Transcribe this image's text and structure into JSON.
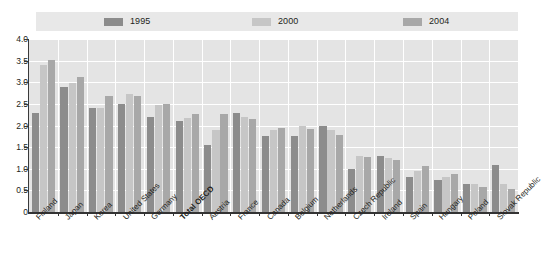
{
  "legend": {
    "items": [
      {
        "label": "1995",
        "color": "#8c8c8c"
      },
      {
        "label": "2000",
        "color": "#c6c6c6"
      },
      {
        "label": "2004",
        "color": "#a8a8a8"
      }
    ]
  },
  "axis": {
    "y_ticks": [
      "4.0",
      "3.5",
      "3.0",
      "2.5",
      "2.0",
      "1.5",
      "1.0",
      "0.5",
      "0"
    ]
  },
  "chart_data": {
    "type": "bar",
    "title": "",
    "subtitle": "",
    "xlabel": "",
    "ylabel": "",
    "ylim": [
      0,
      4.0
    ],
    "ytick_values": [
      0,
      0.5,
      1.0,
      1.5,
      2.0,
      2.5,
      3.0,
      3.5,
      4.0
    ],
    "grid": true,
    "legend_position": "top",
    "categories": [
      "Finland",
      "Japan",
      "Korea",
      "United States",
      "Germany",
      "Total OECD",
      "Austria",
      "France",
      "Canada",
      "Belgium",
      "Netherlands",
      "Czech Republic",
      "Ireland",
      "Spain",
      "Hungary",
      "Poland",
      "Slovak Republic"
    ],
    "emphasized_categories": [
      "Total OECD"
    ],
    "series": [
      {
        "name": "1995",
        "color": "#8c8c8c",
        "values": [
          2.28,
          2.9,
          2.4,
          2.5,
          2.2,
          2.1,
          1.55,
          2.3,
          1.75,
          1.75,
          2.0,
          1.0,
          1.3,
          0.8,
          0.73,
          0.65,
          1.08
        ]
      },
      {
        "name": "2000",
        "color": "#c6c6c6",
        "values": [
          3.4,
          2.99,
          2.4,
          2.72,
          2.48,
          2.18,
          1.9,
          2.2,
          1.9,
          2.0,
          1.9,
          1.3,
          1.25,
          0.94,
          0.8,
          0.66,
          0.65
        ]
      },
      {
        "name": "2004",
        "color": "#a8a8a8",
        "values": [
          3.51,
          3.13,
          2.68,
          2.68,
          2.49,
          2.26,
          2.26,
          2.16,
          1.95,
          1.93,
          1.78,
          1.27,
          1.2,
          1.07,
          0.89,
          0.58,
          0.53
        ]
      }
    ]
  }
}
